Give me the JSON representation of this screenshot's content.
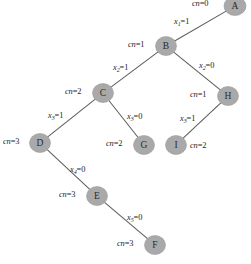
{
  "diagram": {
    "type": "decision-tree",
    "node_fill_color": "#a9a9a9",
    "edge_color": "#5d5d5d",
    "background_color": "#ffffff",
    "nodes": [
      {
        "id": "A",
        "letter": "A",
        "cn_label": "cn=0",
        "cn_value": "0",
        "x": 235,
        "y": 6,
        "rx": 11,
        "ry": 9.5,
        "label_x": 192,
        "label_y": 0,
        "clipped": true
      },
      {
        "id": "B",
        "letter": "B",
        "cn_label": "cn=1",
        "cn_value": "1",
        "x": 166,
        "y": 46,
        "rx": 10.5,
        "ry": 9.5,
        "label_x": 128,
        "label_y": 41
      },
      {
        "id": "C",
        "letter": "C",
        "cn_label": "cn=2",
        "cn_value": "2",
        "x": 103,
        "y": 93,
        "rx": 10.5,
        "ry": 9.5,
        "label_x": 65,
        "label_y": 88
      },
      {
        "id": "H",
        "letter": "H",
        "cn_label": "cn=1",
        "cn_value": "1",
        "x": 228,
        "y": 96,
        "rx": 10.5,
        "ry": 9.5,
        "label_x": 190,
        "label_y": 91
      },
      {
        "id": "D",
        "letter": "D",
        "cn_label": "cn=3",
        "cn_value": "3",
        "x": 40,
        "y": 143,
        "rx": 10.5,
        "ry": 9.5,
        "label_x": 3,
        "label_y": 138
      },
      {
        "id": "G",
        "letter": "G",
        "cn_label": "cn=2",
        "cn_value": "2",
        "x": 144,
        "y": 145,
        "rx": 10.5,
        "ry": 9.5,
        "label_x": 106,
        "label_y": 140
      },
      {
        "id": "I",
        "letter": "I",
        "cn_label": "cn=2",
        "cn_value": "2",
        "x": 176,
        "y": 145,
        "rx": 10.5,
        "ry": 9.5,
        "label_x": 190,
        "label_y": 142
      },
      {
        "id": "E",
        "letter": "E",
        "cn_label": "cn=3",
        "cn_value": "3",
        "x": 97,
        "y": 196,
        "rx": 10.5,
        "ry": 9.5,
        "label_x": 59,
        "label_y": 191
      },
      {
        "id": "F",
        "letter": "F",
        "cn_label": "cn=3",
        "cn_value": "3",
        "x": 155,
        "y": 245,
        "rx": 10.5,
        "ry": 9.5,
        "label_x": 117,
        "label_y": 240
      }
    ],
    "edges": [
      {
        "from": "A",
        "to": "B",
        "var": "x",
        "sub": "1",
        "value": "1",
        "text": "x1=1",
        "label_x": 174,
        "label_y": 18
      },
      {
        "from": "B",
        "to": "C",
        "var": "x",
        "sub": "2",
        "value": "1",
        "text": "x2=1",
        "label_x": 113,
        "label_y": 64
      },
      {
        "from": "B",
        "to": "H",
        "var": "x",
        "sub": "2",
        "value": "0",
        "text": "x2=0",
        "label_x": 199,
        "label_y": 62
      },
      {
        "from": "C",
        "to": "D",
        "var": "x",
        "sub": "3",
        "value": "1",
        "text": "x3=1",
        "label_x": 48,
        "label_y": 112
      },
      {
        "from": "C",
        "to": "G",
        "var": "x",
        "sub": "3",
        "value": "0",
        "text": "x3=0",
        "label_x": 127,
        "label_y": 113
      },
      {
        "from": "H",
        "to": "I",
        "var": "x",
        "sub": "3",
        "value": "1",
        "text": "x3=1",
        "label_x": 180,
        "label_y": 115
      },
      {
        "from": "D",
        "to": "E",
        "var": "x",
        "sub": "4",
        "value": "0",
        "text": "x4=0",
        "label_x": 70,
        "label_y": 166
      },
      {
        "from": "E",
        "to": "F",
        "var": "x",
        "sub": "5",
        "value": "0",
        "text": "x5=0",
        "label_x": 127,
        "label_y": 214
      }
    ]
  }
}
